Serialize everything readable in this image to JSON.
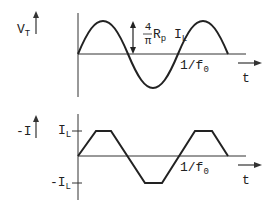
{
  "top_plot": {
    "y_label": "V",
    "y_label_sub": "T",
    "amplitude_num": "4",
    "amplitude_den": "π",
    "amplitude_rest": "R",
    "amplitude_rest_sub": "p",
    "amplitude_I": "I",
    "amplitude_I_sub": "L",
    "period_label": "1/f",
    "period_label_sub": "0",
    "x_label": "t",
    "waveform": "sine"
  },
  "bottom_plot": {
    "y_label": "-I",
    "level_high": "I",
    "level_high_sub": "L",
    "level_low": "-I",
    "level_low_sub": "L",
    "period_label": "1/f",
    "period_label_sub": "0",
    "x_label": "t",
    "waveform": "trapezoid"
  },
  "colors": {
    "stroke": "#222222",
    "background": "#ffffff"
  }
}
